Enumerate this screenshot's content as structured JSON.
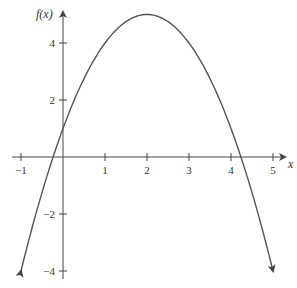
{
  "chart_data": {
    "type": "line",
    "title": "",
    "xlabel": "x",
    "ylabel": "f(x)",
    "function": "f(x) = -x^2 + 4x + 1",
    "vertex": [
      2,
      5
    ],
    "y_intercept": [
      0,
      1
    ],
    "x_intercepts": [
      -0.236,
      4.236
    ],
    "xlim": [
      -1,
      5
    ],
    "ylim": [
      -4,
      5
    ],
    "x_ticks": [
      -1,
      1,
      2,
      3,
      4,
      5
    ],
    "y_ticks": [
      -4,
      -2,
      2,
      4
    ],
    "x_tick_labels": [
      "−1",
      "1",
      "2",
      "3",
      "4",
      "5"
    ],
    "y_tick_labels": [
      "−4",
      "−2",
      "2",
      "4"
    ],
    "grid": false,
    "legend": null,
    "series": [
      {
        "name": "f(x)",
        "x": [
          -1,
          -0.5,
          0,
          0.5,
          1,
          1.5,
          2,
          2.5,
          3,
          3.5,
          4,
          4.5,
          5
        ],
        "values": [
          -4,
          -1.25,
          1,
          2.75,
          4,
          4.75,
          5,
          4.75,
          4,
          2.75,
          1,
          -1.25,
          -4
        ]
      }
    ],
    "curve_ends_with_arrows": true,
    "colors": {
      "curve": "#555555",
      "axes": "#444444"
    }
  },
  "axes": {
    "x_label": "x",
    "y_label": "f(x)"
  }
}
